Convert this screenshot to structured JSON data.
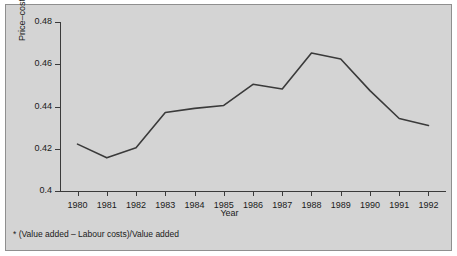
{
  "figure": {
    "background_color": "#d4d4d4",
    "border_color": "#8f8f8f",
    "line_color": "#3a3a3a",
    "axis_color": "#3a3a3a",
    "footnote": "* (Value added – Labour costs)/Value added"
  },
  "chart_data": {
    "type": "line",
    "title": "",
    "xlabel": "Year",
    "ylabel": "Price–cost margin*",
    "categories": [
      "1980",
      "1981",
      "1982",
      "1983",
      "1984",
      "1985",
      "1986",
      "1987",
      "1988",
      "1989",
      "1990",
      "1991",
      "1992"
    ],
    "x": [
      1980,
      1981,
      1982,
      1983,
      1984,
      1985,
      1986,
      1987,
      1988,
      1989,
      1990,
      1991,
      1992
    ],
    "values": [
      0.4222,
      0.4157,
      0.4205,
      0.4372,
      0.4391,
      0.4405,
      0.4505,
      0.4483,
      0.4653,
      0.4625,
      0.4475,
      0.4343,
      0.431
    ],
    "series": [
      {
        "name": "Price–cost margin",
        "values": [
          0.4222,
          0.4157,
          0.4205,
          0.4372,
          0.4391,
          0.4405,
          0.4505,
          0.4483,
          0.4653,
          0.4625,
          0.4475,
          0.4343,
          0.431
        ]
      }
    ],
    "xlim": [
      1979.4,
      1992.6
    ],
    "ylim": [
      0.4,
      0.48
    ],
    "yticks": [
      0.4,
      0.42,
      0.44,
      0.46,
      0.48
    ],
    "ytick_labels": [
      "0.4",
      "0.42",
      "0.44",
      "0.46",
      "0.48"
    ],
    "xticks": [
      1980,
      1981,
      1982,
      1983,
      1984,
      1985,
      1986,
      1987,
      1988,
      1989,
      1990,
      1991,
      1992
    ],
    "xtick_labels": [
      "1980",
      "1981",
      "1982",
      "1983",
      "1984",
      "1985",
      "1986",
      "1987",
      "1988",
      "1989",
      "1990",
      "1991",
      "1992"
    ],
    "grid": false,
    "legend": null,
    "annotations": [
      "* (Value added – Labour costs)/Value added"
    ]
  }
}
